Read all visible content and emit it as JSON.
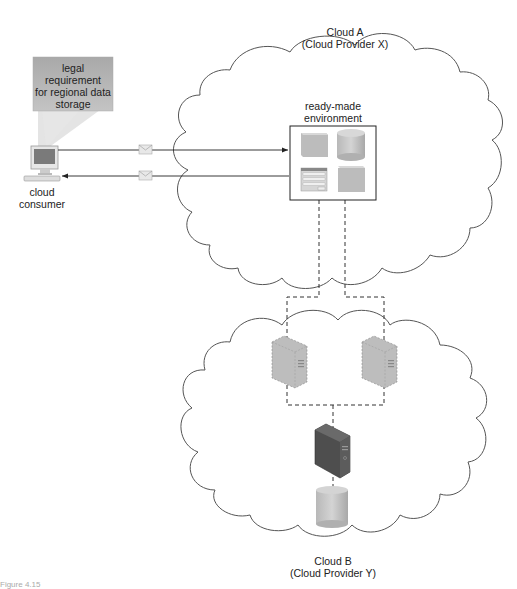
{
  "clouds": {
    "cloud_a": {
      "title": "Cloud A",
      "subtitle": "(Cloud Provider X)"
    },
    "cloud_b": {
      "title": "Cloud B",
      "subtitle": "(Cloud Provider Y)"
    }
  },
  "consumer": {
    "label_line1": "cloud",
    "label_line2": "consumer"
  },
  "callout": {
    "line1": "legal requirement",
    "line2": "for regional data",
    "line3": "storage"
  },
  "environment": {
    "label_line1": "ready-made",
    "label_line2": "environment"
  },
  "messages": [
    {
      "direction": "consumer-to-environment",
      "icon": "envelope-icon"
    },
    {
      "direction": "environment-to-consumer",
      "icon": "envelope-icon"
    }
  ],
  "cloud_b_components": [
    {
      "type": "virtual-server",
      "icon": "server-icon",
      "style": "dashed"
    },
    {
      "type": "virtual-server",
      "icon": "server-icon",
      "style": "dashed"
    },
    {
      "type": "physical-server",
      "icon": "server-icon",
      "style": "solid-dark"
    },
    {
      "type": "storage-device",
      "icon": "database-icon"
    }
  ],
  "colors": {
    "line": "#333333",
    "callout_fill": "#a8a8a8",
    "icon_gray": "#b5b5b5",
    "server_dark": "#555555"
  },
  "caption": "Figure 4.15"
}
